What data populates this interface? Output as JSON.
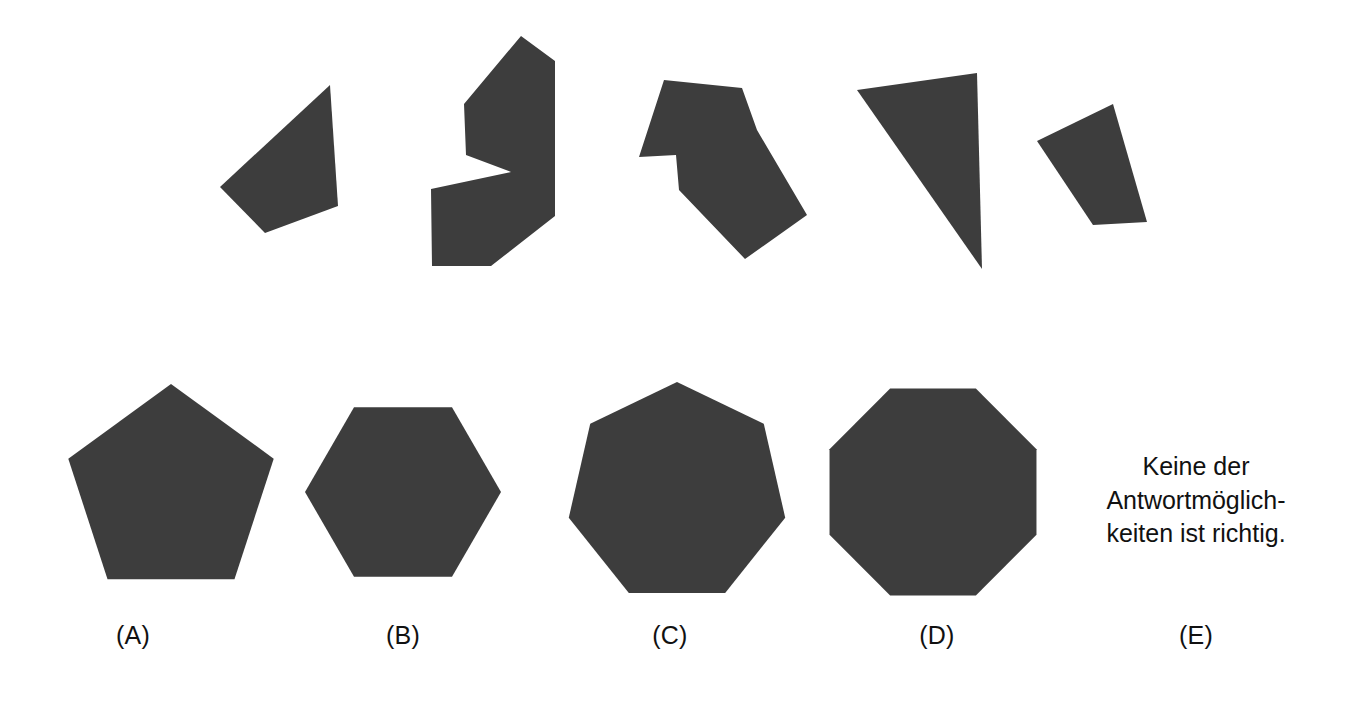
{
  "page": {
    "width": 1364,
    "height": 703,
    "background_color": "#ffffff",
    "shape_fill_color": "#3d3d3d",
    "text_color": "#111111"
  },
  "stimulus": {
    "description": "Five dark irregular polygon pieces arranged in a row across the upper half of the page",
    "count": 5,
    "pieces": [
      {
        "name": "piece-1",
        "kind": "convex-quadrilateral",
        "vertex_count": 4,
        "points": "330,85 338,206 265,233 220,187"
      },
      {
        "name": "piece-2",
        "kind": "concave-heptagon",
        "vertex_count": 7,
        "points": "521,36 555,61 555,216 491,266 432,266 431,189 511,172 466,155 464,104"
      },
      {
        "name": "piece-3",
        "kind": "concave-heptagon",
        "vertex_count": 8,
        "points": "664,80 742,88 757,130 807,215 745,259 679,190 676,155 639,157"
      },
      {
        "name": "piece-4",
        "kind": "triangle",
        "vertex_count": 3,
        "points": "857,90 977,73 982,269"
      },
      {
        "name": "piece-5",
        "kind": "convex-quadrilateral",
        "vertex_count": 4,
        "points": "1113,104 1147,222 1093,225 1037,141"
      }
    ]
  },
  "answers": {
    "options": [
      {
        "id": "A",
        "label": "(A)",
        "shape": "pentagon",
        "sides": 5,
        "center_x": 171,
        "center_y": 492,
        "radius": 108,
        "rotation_deg": 0,
        "label_x": 133,
        "label_y": 623
      },
      {
        "id": "B",
        "label": "(B)",
        "shape": "hexagon",
        "sides": 6,
        "center_x": 403,
        "center_y": 492,
        "radius": 98,
        "rotation_deg": 90,
        "label_x": 403,
        "label_y": 623
      },
      {
        "id": "C",
        "label": "(C)",
        "shape": "heptagon",
        "sides": 7,
        "center_x": 677,
        "center_y": 493,
        "radius": 111,
        "rotation_deg": 0,
        "label_x": 670,
        "label_y": 623
      },
      {
        "id": "D",
        "label": "(D)",
        "shape": "octagon",
        "sides": 8,
        "center_x": 933,
        "center_y": 492,
        "radius": 112,
        "rotation_deg": 22.5,
        "label_x": 937,
        "label_y": 623
      },
      {
        "id": "E",
        "label": "(E)",
        "shape": "text-only",
        "sides": 0,
        "label_x": 1196,
        "label_y": 623
      }
    ],
    "option_e_text": "Keine der\nAntwortmöglich-\nkeiten ist richtig."
  }
}
